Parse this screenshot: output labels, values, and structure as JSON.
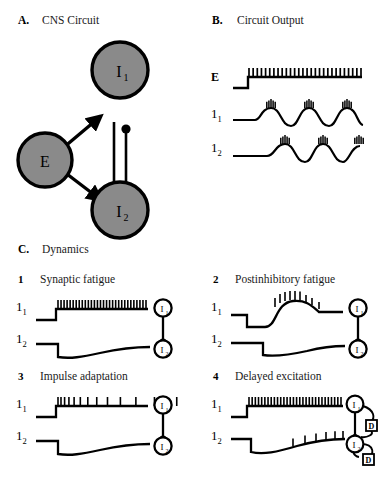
{
  "figure": {
    "panels": [
      {
        "id": "A",
        "label": "A.",
        "title": "CNS Circuit",
        "type": "circuit-diagram",
        "nodes": [
          {
            "name": "E",
            "role": "excitatory",
            "label": "E",
            "sub": "",
            "cx": 45,
            "cy": 122
          },
          {
            "name": "I1",
            "role": "inhibitory",
            "label": "I",
            "sub": "1",
            "cx": 120,
            "cy": 70
          },
          {
            "name": "I2",
            "role": "inhibitory",
            "label": "I",
            "sub": "2",
            "cx": 120,
            "cy": 172
          }
        ],
        "connections": [
          {
            "from": "E",
            "to": "I1",
            "terminal": "arrow",
            "meaning": "excitatory"
          },
          {
            "from": "E",
            "to": "I2",
            "terminal": "arrow",
            "meaning": "excitatory"
          },
          {
            "from": "I1",
            "to": "I2",
            "terminal": "ball",
            "meaning": "inhibitory"
          },
          {
            "from": "I2",
            "to": "I1",
            "terminal": "ball",
            "meaning": "inhibitory"
          }
        ],
        "node_fill": "#8a8a8a",
        "node_stroke": "#000000"
      },
      {
        "id": "B",
        "label": "B.",
        "title": "Circuit Output",
        "type": "traces",
        "traces": [
          {
            "name": "E",
            "label": "E",
            "sub": "",
            "pattern": "step-then-tonic-spikes",
            "spike_count": 28
          },
          {
            "name": "I1",
            "label": "1",
            "sub": "1",
            "pattern": "oscillation-with-bursts",
            "cycles": 3,
            "spikes_per_burst": 5,
            "phase": "leading"
          },
          {
            "name": "I2",
            "label": "1",
            "sub": "2",
            "pattern": "oscillation-with-bursts",
            "cycles": 3,
            "spikes_per_burst": 5,
            "phase": "antiphase"
          }
        ]
      }
    ],
    "panelC": {
      "label": "C.",
      "title": "Dynamics",
      "items": [
        {
          "number": "1",
          "title": "Synaptic fatigue",
          "traces": [
            {
              "label": "1",
              "sub": "1",
              "pattern": "step-then-tonic-spikes",
              "spike_count": 30,
              "spacing": "uniform"
            },
            {
              "label": "1",
              "sub": "2",
              "pattern": "hyperpolarization-slow-recovery"
            }
          ],
          "icon": {
            "type": "two-node-inhibition",
            "nodes": [
              "I1",
              "I2"
            ],
            "delays": 0
          }
        },
        {
          "number": "2",
          "title": "Postinhibitory fatigue",
          "traces": [
            {
              "label": "1",
              "sub": "1",
              "pattern": "dip-then-rebound-burst",
              "spike_count": 9
            },
            {
              "label": "1",
              "sub": "2",
              "pattern": "delayed-hyperpolarization-recovery"
            }
          ],
          "icon": {
            "type": "two-node-inhibition",
            "nodes": [
              "I1",
              "I2"
            ],
            "delays": 0
          }
        },
        {
          "number": "3",
          "title": "Impulse adaptation",
          "traces": [
            {
              "label": "1",
              "sub": "1",
              "pattern": "step-then-adapting-spikes",
              "spike_count": 13,
              "spacing": "increasing"
            },
            {
              "label": "1",
              "sub": "2",
              "pattern": "hyperpolarization-slow-recovery"
            }
          ],
          "icon": {
            "type": "two-node-inhibition",
            "nodes": [
              "I1",
              "I2"
            ],
            "delays": 0
          }
        },
        {
          "number": "4",
          "title": "Delayed excitation",
          "traces": [
            {
              "label": "1",
              "sub": "1",
              "pattern": "step-then-tonic-spikes",
              "spike_count": 30,
              "spacing": "uniform"
            },
            {
              "label": "1",
              "sub": "2",
              "pattern": "hyperpolarization-ramp-then-late-spikes",
              "spike_count": 6
            }
          ],
          "icon": {
            "type": "two-node-inhibition-with-delay",
            "nodes": [
              "I1",
              "I2"
            ],
            "delay_label": "D",
            "delays": 2
          }
        }
      ]
    }
  }
}
